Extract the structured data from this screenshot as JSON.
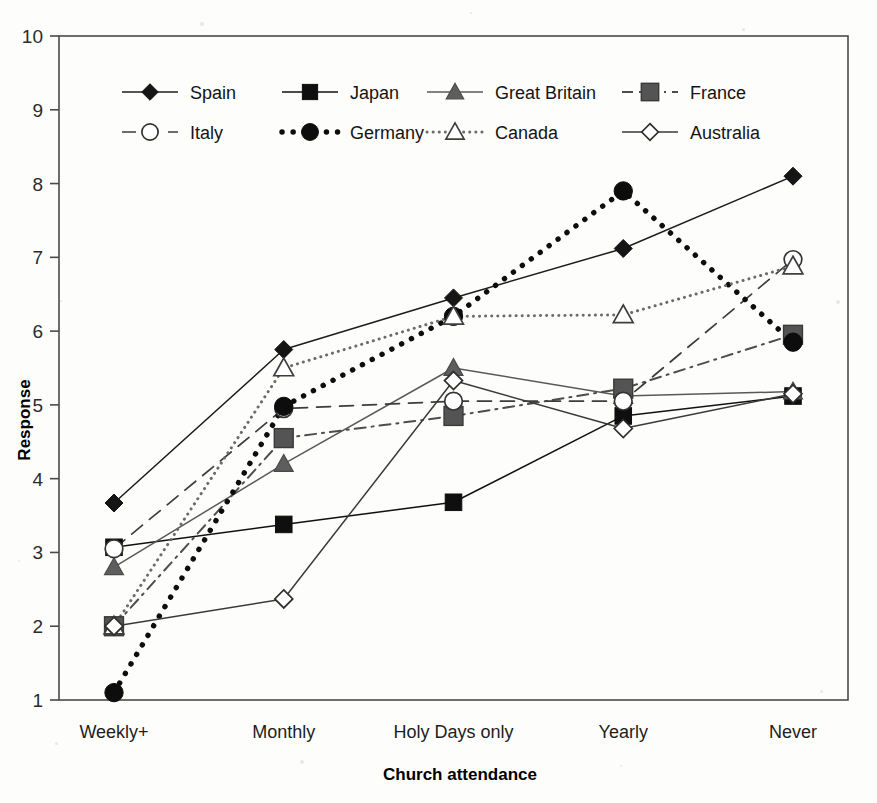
{
  "chart_data": {
    "type": "line",
    "title": "",
    "xlabel": "Church attendance",
    "ylabel": "Response",
    "categories": [
      "Weekly+",
      "Monthly",
      "Holy Days only",
      "Yearly",
      "Never"
    ],
    "ylim": [
      1,
      10
    ],
    "yticks": [
      1,
      2,
      3,
      4,
      5,
      6,
      7,
      8,
      9,
      10
    ],
    "grid": false,
    "legend_position": "top-inside",
    "series": [
      {
        "name": "Spain",
        "marker": "filled-diamond",
        "line_style": "solid",
        "color": "#1c1c1c",
        "values": [
          3.67,
          5.75,
          6.45,
          7.12,
          8.1
        ]
      },
      {
        "name": "Japan",
        "marker": "filled-square",
        "line_style": "solid",
        "color": "#111111",
        "values": [
          3.07,
          3.38,
          3.68,
          4.85,
          5.12
        ]
      },
      {
        "name": "Great Britain",
        "marker": "filled-triangle",
        "line_style": "solid",
        "color": "#595959",
        "values": [
          2.8,
          4.2,
          5.5,
          5.12,
          5.18
        ]
      },
      {
        "name": "France",
        "marker": "filled-square-gray",
        "line_style": "dash-dot",
        "color": "#4d4d4d",
        "values": [
          2.0,
          4.55,
          4.85,
          5.22,
          5.95
        ]
      },
      {
        "name": "Italy",
        "marker": "open-circle",
        "line_style": "dashed",
        "color": "#3d3d3d",
        "values": [
          3.05,
          4.95,
          5.05,
          5.05,
          6.97
        ]
      },
      {
        "name": "Germany",
        "marker": "filled-circle",
        "line_style": "dotted-bold",
        "color": "#0d0d0d",
        "values": [
          1.1,
          4.98,
          6.2,
          7.9,
          5.85
        ]
      },
      {
        "name": "Canada",
        "marker": "open-triangle",
        "line_style": "dotted-fine",
        "color": "#6b6b6b",
        "values": [
          2.0,
          5.5,
          6.2,
          6.22,
          6.88
        ]
      },
      {
        "name": "Australia",
        "marker": "open-diamond",
        "line_style": "solid",
        "color": "#3a3a3a",
        "values": [
          2.0,
          2.37,
          5.33,
          4.68,
          5.15
        ]
      }
    ]
  },
  "legend": {
    "row1": [
      "Spain",
      "Japan",
      "Great Britain",
      "France"
    ],
    "row2": [
      "Italy",
      "Germany",
      "Canada",
      "Australia"
    ]
  },
  "axes": {
    "y_title": "Response",
    "x_title": "Church attendance",
    "y_tick_labels": [
      "10",
      "9",
      "8",
      "7",
      "6",
      "5",
      "4",
      "3",
      "2",
      "1"
    ],
    "x_tick_labels": [
      "Weekly+",
      "Monthly",
      "Holy Days only",
      "Yearly",
      "Never"
    ]
  }
}
